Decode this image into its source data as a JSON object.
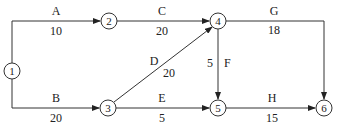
{
  "diagram": {
    "type": "activity-on-arrow network",
    "nodes": [
      {
        "id": "1",
        "label": "1",
        "x": 12,
        "y": 71
      },
      {
        "id": "2",
        "label": "2",
        "x": 109,
        "y": 21
      },
      {
        "id": "3",
        "label": "3",
        "x": 108,
        "y": 108
      },
      {
        "id": "4",
        "label": "4",
        "x": 218,
        "y": 21
      },
      {
        "id": "5",
        "label": "5",
        "x": 218,
        "y": 108
      },
      {
        "id": "6",
        "label": "6",
        "x": 324,
        "y": 108
      }
    ],
    "activities": [
      {
        "name": "A",
        "duration": "10",
        "from": "1",
        "to": "2"
      },
      {
        "name": "B",
        "duration": "20",
        "from": "1",
        "to": "3"
      },
      {
        "name": "C",
        "duration": "20",
        "from": "2",
        "to": "4"
      },
      {
        "name": "D",
        "duration": "20",
        "from": "3",
        "to": "4"
      },
      {
        "name": "E",
        "duration": "5",
        "from": "3",
        "to": "5"
      },
      {
        "name": "F",
        "duration": "5",
        "from": "4",
        "to": "5"
      },
      {
        "name": "G",
        "duration": "18",
        "from": "4",
        "to": "6"
      },
      {
        "name": "H",
        "duration": "15",
        "from": "5",
        "to": "6"
      }
    ]
  }
}
